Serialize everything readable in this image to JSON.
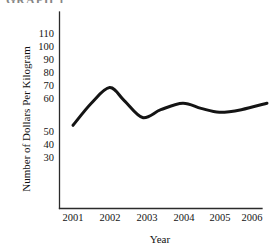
{
  "figure": {
    "clipped_header_text": "GRAPH 1",
    "background_color": "#ffffff",
    "ink_color": "#141414"
  },
  "chart_data": {
    "type": "line",
    "title": "",
    "xlabel": "Year",
    "ylabel": "Number of Dollars Per Kilogram",
    "categories": [
      "2001",
      "2002",
      "2003",
      "2004",
      "2005",
      "2006"
    ],
    "x": [
      2001,
      2002,
      2003,
      2004,
      2005,
      2006
    ],
    "values": [
      40,
      68,
      45,
      56,
      49,
      55
    ],
    "series": [
      {
        "name": "Dollars Per Kilogram",
        "color": "#141414",
        "line_width": 3,
        "values": [
          40,
          68,
          45,
          56,
          49,
          55
        ]
      }
    ],
    "xlim": [
      2000.6,
      2006.5
    ],
    "ylim": [
      18,
      116
    ],
    "ytick_labels": [
      "110",
      "100",
      "90",
      "80",
      "70",
      "60",
      "50",
      "40",
      "30"
    ],
    "ytick_values": [
      110,
      100,
      90,
      80,
      70,
      60,
      50,
      40,
      30
    ],
    "xtick_labels": [
      "2001",
      "2002",
      "2003",
      "2004",
      "2005",
      "2006"
    ],
    "grid": false,
    "legend": "none",
    "annotations": [],
    "smoothing": "spline",
    "curve_points": [
      {
        "x": 2001.0,
        "y": 39
      },
      {
        "x": 2001.5,
        "y": 56
      },
      {
        "x": 2002.0,
        "y": 68
      },
      {
        "x": 2002.4,
        "y": 58
      },
      {
        "x": 2002.9,
        "y": 45
      },
      {
        "x": 2003.4,
        "y": 51
      },
      {
        "x": 2004.0,
        "y": 56
      },
      {
        "x": 2004.5,
        "y": 52
      },
      {
        "x": 2005.0,
        "y": 49
      },
      {
        "x": 2005.6,
        "y": 51
      },
      {
        "x": 2006.3,
        "y": 56
      }
    ]
  }
}
